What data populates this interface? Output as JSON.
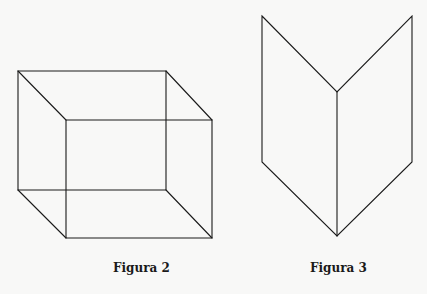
{
  "figures": [
    {
      "id": "figure-2",
      "caption": "Figura 2",
      "shape": "wireframe-cube",
      "stroke_color": "#1a1a1a",
      "vertices": {
        "back_top_left": [
          18,
          71
        ],
        "back_top_right": [
          166,
          71
        ],
        "back_bottom_left": [
          18,
          190
        ],
        "back_bottom_right": [
          166,
          190
        ],
        "front_top_left": [
          66,
          120
        ],
        "front_top_right": [
          212,
          120
        ],
        "front_bottom_left": [
          66,
          238
        ],
        "front_bottom_right": [
          212,
          238
        ]
      }
    },
    {
      "id": "figure-3",
      "caption": "Figura 3",
      "shape": "folded-v-prism",
      "stroke_color": "#1a1a1a",
      "vertices": {
        "top_left": [
          262,
          16
        ],
        "top_right": [
          412,
          16
        ],
        "top_center": [
          337,
          92
        ],
        "bottom_left": [
          262,
          162
        ],
        "bottom_right": [
          412,
          162
        ],
        "bottom_center": [
          337,
          236
        ]
      }
    }
  ],
  "background_color": "#f8f8f7"
}
